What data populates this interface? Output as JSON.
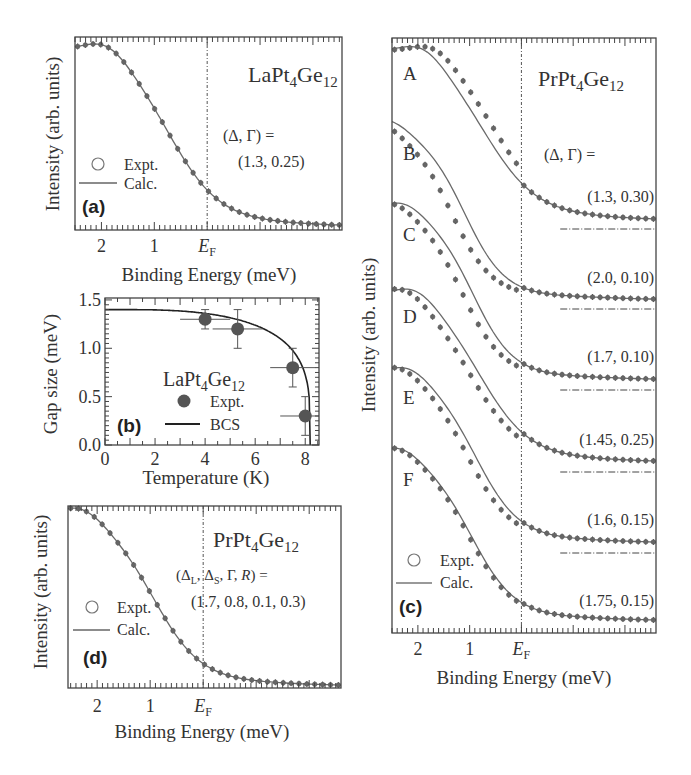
{
  "chart_data": [
    {
      "id": "a",
      "type": "line",
      "panel_label": "(a)",
      "title": "LaPt4Ge12",
      "compound": {
        "base": "LaPt",
        "sub1": "4",
        "mid": "Ge",
        "sub2": "12"
      },
      "xlabel": "Binding Energy (meV)",
      "ylabel": "Intensity (arb. units)",
      "x_ticks": [
        {
          "value": 2,
          "label": "2"
        },
        {
          "value": 1,
          "label": "1"
        },
        {
          "value": 0,
          "label": "E",
          "sub": "F"
        }
      ],
      "xlim": [
        2.5,
        -2.55
      ],
      "ylim": [
        0,
        1.1
      ],
      "x_reversed": true,
      "fermi_line": 0,
      "params_label": "(Δ, Γ) =",
      "params_value": "(1.3, 0.25)",
      "params": {
        "delta": 1.3,
        "gamma": 0.25
      },
      "legend": [
        {
          "marker": "circle-open",
          "label": "Expt."
        },
        {
          "marker": "line",
          "label": "Calc."
        }
      ],
      "legend_position": "bottom-left",
      "series": [
        {
          "name": "Expt.",
          "kind": "points",
          "fit_offset": 0.0
        },
        {
          "name": "Calc.",
          "kind": "line"
        }
      ]
    },
    {
      "id": "b",
      "type": "scatter",
      "panel_label": "(b)",
      "title": "LaPt4Ge12",
      "compound": {
        "base": "LaPt",
        "sub1": "4",
        "mid": "Ge",
        "sub2": "12"
      },
      "xlabel": "Temperature (K)",
      "ylabel": "Gap size (meV)",
      "x_ticks": [
        0,
        2,
        4,
        6,
        8
      ],
      "y_ticks": [
        "0.0",
        "0.5",
        "1.0",
        "1.5"
      ],
      "xlim": [
        0,
        8.55
      ],
      "ylim": [
        0,
        1.52
      ],
      "legend": [
        {
          "marker": "circle-filled",
          "label": "Expt."
        },
        {
          "marker": "line",
          "label": "BCS"
        }
      ],
      "legend_position": "bottom-center",
      "series": [
        {
          "name": "Expt.",
          "points": [
            {
              "x": 4.0,
              "y": 1.3,
              "xerr": 1.0,
              "yerr": 0.1
            },
            {
              "x": 5.3,
              "y": 1.2,
              "xerr": 1.0,
              "yerr": 0.2
            },
            {
              "x": 7.5,
              "y": 0.8,
              "xerr": 0.9,
              "yerr": 0.2
            },
            {
              "x": 8.0,
              "y": 0.3,
              "xerr": 1.0,
              "yerr": 0.2
            }
          ]
        },
        {
          "name": "BCS",
          "delta0": 1.4,
          "Tc": 8.2
        }
      ]
    },
    {
      "id": "c",
      "type": "line",
      "panel_label": "(c)",
      "title": "PrPt4Ge12",
      "compound": {
        "base": "PrPt",
        "sub1": "4",
        "mid": "Ge",
        "sub2": "12"
      },
      "xlabel": "Binding Energy (meV)",
      "ylabel": "Intensity (arb. units)",
      "x_ticks": [
        {
          "value": 2,
          "label": "2"
        },
        {
          "value": 1,
          "label": "1"
        },
        {
          "value": 0,
          "label": "E",
          "sub": "F"
        }
      ],
      "xlim": [
        2.5,
        -2.6
      ],
      "x_reversed": true,
      "fermi_line": 0,
      "params_label": "(Δ, Γ) =",
      "legend": [
        {
          "marker": "circle-open",
          "label": "Expt."
        },
        {
          "marker": "line",
          "label": "Calc."
        }
      ],
      "legend_position": "bottom-left",
      "series": [
        {
          "name": "A",
          "params_value": "(1.3, 0.30)",
          "delta": 1.3,
          "gamma": 0.3,
          "fit_shift": 0.22
        },
        {
          "name": "B",
          "params_value": "(2.0, 0.10)",
          "delta": 2.0,
          "gamma": 0.1,
          "fit_shift": -0.25
        },
        {
          "name": "C",
          "params_value": "(1.7, 0.10)",
          "delta": 1.7,
          "gamma": 0.1,
          "fit_shift": -0.2
        },
        {
          "name": "D",
          "params_value": "(1.45, 0.25)",
          "delta": 1.45,
          "gamma": 0.25,
          "fit_shift": -0.18
        },
        {
          "name": "E",
          "params_value": "(1.6, 0.15)",
          "delta": 1.6,
          "gamma": 0.15,
          "fit_shift": -0.15
        },
        {
          "name": "F",
          "params_value": "(1.75, 0.15)",
          "delta": 1.75,
          "gamma": 0.15,
          "fit_shift": -0.05
        }
      ]
    },
    {
      "id": "d",
      "type": "line",
      "panel_label": "(d)",
      "title": "PrPt4Ge12",
      "compound": {
        "base": "PrPt",
        "sub1": "4",
        "mid": "Ge",
        "sub2": "12"
      },
      "xlabel": "Binding Energy (meV)",
      "ylabel": "Intensity (arb. units)",
      "x_ticks": [
        {
          "value": 2,
          "label": "2"
        },
        {
          "value": 1,
          "label": "1"
        },
        {
          "value": 0,
          "label": "E",
          "sub": "F"
        }
      ],
      "xlim": [
        2.55,
        -2.6
      ],
      "x_reversed": true,
      "fermi_line": 0,
      "params_label_parts": [
        "(Δ",
        "L",
        ", Δ",
        "S",
        ", Γ, ",
        "R",
        ") ="
      ],
      "params_value": "(1.7, 0.8, 0.1, 0.3)",
      "params": {
        "delta_L": 1.7,
        "delta_S": 0.8,
        "gamma": 0.1,
        "R": 0.3
      },
      "legend": [
        {
          "marker": "circle-open",
          "label": "Expt."
        },
        {
          "marker": "line",
          "label": "Calc."
        }
      ],
      "legend_position": "bottom-left",
      "series": [
        {
          "name": "Expt.",
          "kind": "points"
        },
        {
          "name": "Calc.",
          "kind": "line"
        }
      ]
    }
  ]
}
